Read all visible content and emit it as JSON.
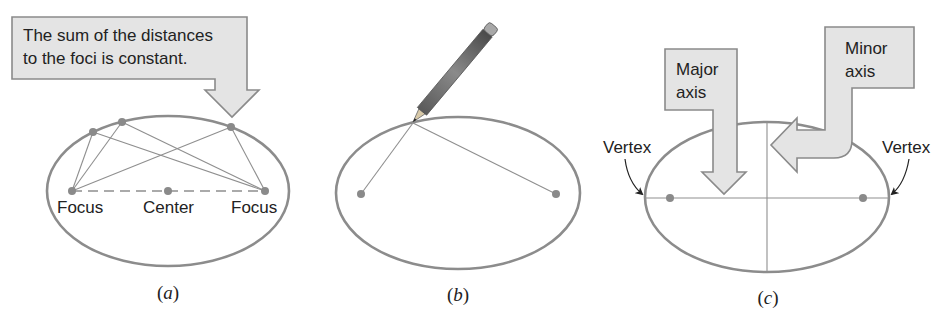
{
  "figure": {
    "panels": [
      {
        "id": "a",
        "caption": "a",
        "callout": {
          "lines": [
            "The sum of the distances",
            "to the foci is constant."
          ]
        },
        "labels": {
          "left_focus": "Focus",
          "center": "Center",
          "right_focus": "Focus"
        }
      },
      {
        "id": "b",
        "caption": "b",
        "icons": [
          "pencil-icon"
        ]
      },
      {
        "id": "c",
        "caption": "c",
        "major_callout": {
          "lines": [
            "Major",
            "axis"
          ]
        },
        "minor_callout": {
          "lines": [
            "Minor",
            "axis"
          ]
        },
        "labels": {
          "left_vertex": "Vertex",
          "right_vertex": "Vertex"
        }
      }
    ],
    "colors": {
      "ellipse_stroke": "#8c8c8c",
      "callout_fill": "#e4e4e4",
      "callout_stroke": "#8a8a8a",
      "point": "#8a8a8a",
      "text": "#222222"
    }
  }
}
